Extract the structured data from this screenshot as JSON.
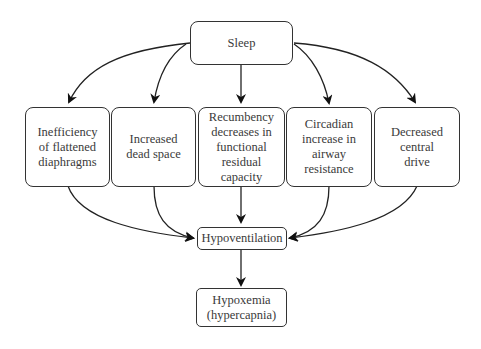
{
  "diagram": {
    "root": {
      "label": "Sleep"
    },
    "causes": [
      {
        "label": "Inefficiency\nof flattened\ndiaphragms"
      },
      {
        "label": "Increased\ndead space"
      },
      {
        "label": "Recumbency\ndecreases in\nfunctional\nresidual\ncapacity"
      },
      {
        "label": "Circadian\nincrease in\nairway\nresistance"
      },
      {
        "label": "Decreased\ncentral\ndrive"
      }
    ],
    "middle": {
      "label": "Hypoventilation"
    },
    "result": {
      "label": "Hypoxemia\n(hypercapnia)"
    },
    "edges": [
      {
        "from": "Sleep",
        "to": "Inefficiency of flattened diaphragms"
      },
      {
        "from": "Sleep",
        "to": "Increased dead space"
      },
      {
        "from": "Sleep",
        "to": "Recumbency decreases in functional residual capacity"
      },
      {
        "from": "Sleep",
        "to": "Circadian increase in airway resistance"
      },
      {
        "from": "Sleep",
        "to": "Decreased central drive"
      },
      {
        "from": "Inefficiency of flattened diaphragms",
        "to": "Hypoventilation"
      },
      {
        "from": "Increased dead space",
        "to": "Hypoventilation"
      },
      {
        "from": "Recumbency decreases in functional residual capacity",
        "to": "Hypoventilation"
      },
      {
        "from": "Circadian increase in airway resistance",
        "to": "Hypoventilation"
      },
      {
        "from": "Decreased central drive",
        "to": "Hypoventilation"
      },
      {
        "from": "Hypoventilation",
        "to": "Hypoxemia (hypercapnia)"
      }
    ]
  }
}
